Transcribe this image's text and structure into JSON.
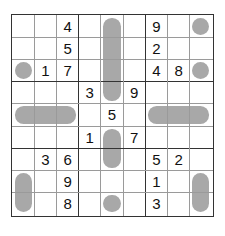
{
  "puzzle": {
    "type": "sudoku",
    "size": 9,
    "grid": [
      [
        "",
        "",
        "4",
        "",
        "",
        "",
        "9",
        "",
        ""
      ],
      [
        "",
        "",
        "5",
        "",
        "",
        "",
        "2",
        "",
        ""
      ],
      [
        "",
        "1",
        "7",
        "",
        "",
        "",
        "4",
        "8",
        ""
      ],
      [
        "",
        "",
        "",
        "3",
        "",
        "9",
        "",
        "",
        ""
      ],
      [
        "",
        "",
        "",
        "",
        "5",
        "",
        "",
        "",
        ""
      ],
      [
        "",
        "",
        "",
        "1",
        "",
        "7",
        "",
        "",
        ""
      ],
      [
        "",
        "3",
        "6",
        "",
        "",
        "",
        "5",
        "2",
        ""
      ],
      [
        "",
        "",
        "9",
        "",
        "",
        "",
        "1",
        "",
        ""
      ],
      [
        "",
        "",
        "8",
        "",
        "",
        "",
        "3",
        "",
        ""
      ]
    ],
    "shaded_shapes": [
      {
        "kind": "vertical-pill",
        "col": 4,
        "row_start": 0,
        "row_end": 3
      },
      {
        "kind": "circle",
        "col": 8,
        "row": 0
      },
      {
        "kind": "circle",
        "col": 0,
        "row": 2
      },
      {
        "kind": "circle",
        "col": 8,
        "row": 2
      },
      {
        "kind": "horizontal-pill",
        "row": 4,
        "col_start": 0,
        "col_end": 2
      },
      {
        "kind": "horizontal-pill",
        "row": 4,
        "col_start": 6,
        "col_end": 8
      },
      {
        "kind": "vertical-pill",
        "col": 4,
        "row_start": 5,
        "row_end": 6
      },
      {
        "kind": "vertical-pill",
        "col": 0,
        "row_start": 7,
        "row_end": 8
      },
      {
        "kind": "vertical-pill",
        "col": 8,
        "row_start": 7,
        "row_end": 8
      },
      {
        "kind": "circle",
        "col": 4,
        "row": 8
      }
    ],
    "colors": {
      "shade": "#a8a8a8",
      "thick_line": "#333333",
      "thin_line": "#9a9a9a",
      "digit": "#111111"
    }
  }
}
